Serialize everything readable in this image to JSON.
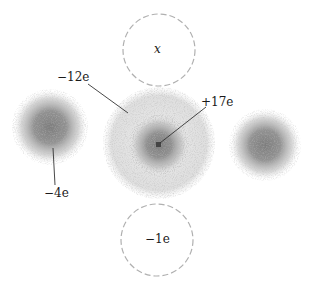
{
  "diagram": {
    "type": "electron-cloud-charge-distribution",
    "labels": {
      "top_circle": "x",
      "outer_shell": "−12e",
      "nucleus": "+17e",
      "left_cloud": "−4e",
      "bottom_circle": "−1e"
    },
    "colors": {
      "cloud": "#8a8a8a",
      "dashed_circle": "#b0b0b0",
      "leader_line": "#333333",
      "nucleus": "#444444"
    },
    "elements": [
      {
        "id": "top-circle",
        "shape": "dashed-circle",
        "cx": 159,
        "cy": 50,
        "r": 36,
        "label": "x"
      },
      {
        "id": "central-atom",
        "shape": "cloud",
        "cx": 159,
        "cy": 143,
        "r_outer": 55,
        "r_core": 25
      },
      {
        "id": "left-cloud",
        "shape": "cloud",
        "cx": 52,
        "cy": 127,
        "r": 35,
        "label": "−4e"
      },
      {
        "id": "right-cloud",
        "shape": "cloud",
        "cx": 265,
        "cy": 143,
        "r": 35
      },
      {
        "id": "bottom-circle",
        "shape": "dashed-circle",
        "cx": 157,
        "cy": 240,
        "r": 36,
        "label": "−1e"
      }
    ]
  }
}
